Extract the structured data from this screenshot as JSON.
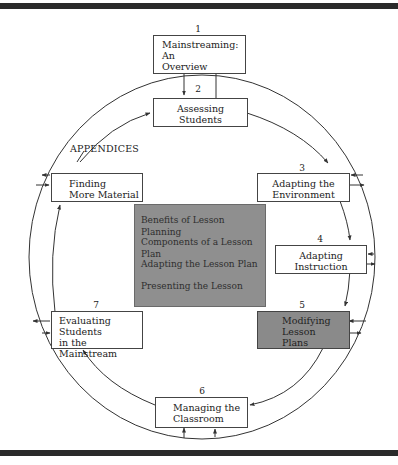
{
  "diagram": {
    "type": "cycle-flowchart",
    "title": "",
    "nodes": [
      {
        "id": "1",
        "number": "1",
        "label_lines": [
          "Mainstreaming:",
          "An",
          "Overview"
        ],
        "shaded": false
      },
      {
        "id": "2",
        "number": "2",
        "label_lines": [
          "Assessing",
          "Students"
        ],
        "shaded": false
      },
      {
        "id": "3",
        "number": "3",
        "label_lines": [
          "Adapting the",
          "Environment"
        ],
        "shaded": false
      },
      {
        "id": "4",
        "number": "4",
        "label_lines": [
          "Adapting",
          "Instruction"
        ],
        "shaded": false
      },
      {
        "id": "5",
        "number": "5",
        "label_lines": [
          "Modifying",
          "Lesson",
          "Plans"
        ],
        "shaded": true
      },
      {
        "id": "6",
        "number": "6",
        "label_lines": [
          "Managing the",
          "Classroom"
        ],
        "shaded": false
      },
      {
        "id": "7",
        "number": "7",
        "label_lines": [
          "Evaluating Students",
          "in the",
          "Mainstream"
        ],
        "shaded": false
      },
      {
        "id": "appendices",
        "number": "",
        "caption": "APPENDICES",
        "label_lines": [
          "Finding",
          "More Material"
        ],
        "shaded": false
      }
    ],
    "center_panel": {
      "items": [
        "Benefits of Lesson Planning",
        "Components of a Lesson Plan",
        "Adapting the Lesson Plan",
        "Presenting the Lesson"
      ]
    },
    "flow_order": [
      "2",
      "3",
      "4",
      "5",
      "6",
      "7",
      "appendices",
      "2"
    ],
    "colors": {
      "shaded_box": "#8a8a8a",
      "center_panel": "#8f8f8f",
      "rule_bar": "#2a2a2a",
      "line": "#333333"
    }
  }
}
